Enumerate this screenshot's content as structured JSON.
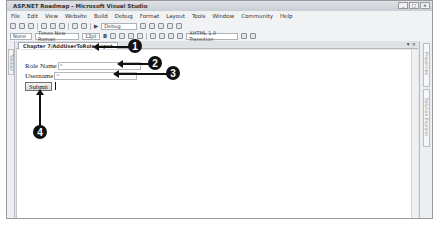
{
  "window": {
    "title": "ASP.NET Roadmap - Microsoft Visual Studio",
    "controls": [
      "_",
      "□",
      "×"
    ]
  },
  "menu": [
    "File",
    "Edit",
    "View",
    "Website",
    "Build",
    "Debug",
    "Format",
    "Layout",
    "Tools",
    "Window",
    "Community",
    "Help"
  ],
  "toolbar1": {
    "config_combo": "Debug"
  },
  "toolbar2": {
    "block_format": "None",
    "font_name": "Times New Roman",
    "font_size": "12pt",
    "bold_label": "B",
    "doctype": "XHTML 1.0 Transition"
  },
  "left_panel": {
    "toolbox_label": "Toolbox"
  },
  "document": {
    "tab_label": "Chapter 7/AddUserToRole.aspx*",
    "tab_controls": [
      "▾",
      "×"
    ]
  },
  "form": {
    "role_name_label": "Role Name",
    "role_name_value": "",
    "username_label": "Username",
    "username_value": "",
    "submit_label": "Submit"
  },
  "right_panel": {
    "tabs": [
      "Properties",
      "Solution Explorer"
    ]
  },
  "callouts": [
    "1",
    "2",
    "3",
    "4"
  ]
}
